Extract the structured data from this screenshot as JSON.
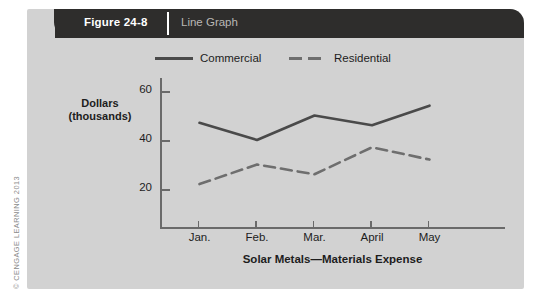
{
  "banner": {
    "figure_number": "Figure 24-8",
    "title": "Line Graph"
  },
  "copyright": "© CENGAGE LEARNING 2013",
  "chart_data": {
    "type": "line",
    "title": "",
    "xlabel": "Solar Metals—Materials Expense",
    "ylabel": "Dollars (thousands)",
    "ylabel_line1": "Dollars",
    "ylabel_line2": "(thousands)",
    "categories": [
      "Jan.",
      "Feb.",
      "Mar.",
      "April",
      "May"
    ],
    "yticks": [
      20,
      40,
      60
    ],
    "ylim": [
      0,
      65
    ],
    "grid": false,
    "legend_position": "top",
    "series": [
      {
        "name": "Commercial",
        "style": "solid",
        "color": "#4a4a4a",
        "values": [
          47,
          40,
          50,
          46,
          54
        ]
      },
      {
        "name": "Residential",
        "style": "dashed",
        "color": "#6e6e6e",
        "values": [
          22,
          30,
          26,
          37,
          32
        ]
      }
    ]
  }
}
